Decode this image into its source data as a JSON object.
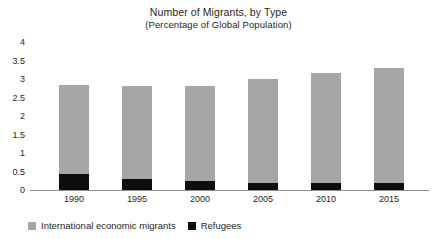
{
  "chart_data": {
    "type": "bar",
    "title": "Number of Migrants, by Type",
    "subtitle": "(Percentage of Global Population)",
    "xlabel": "",
    "ylabel": "",
    "stacked": true,
    "grid": false,
    "legend_position": "bottom-left",
    "ylim": [
      0,
      4
    ],
    "yticks": [
      0,
      0.5,
      1,
      1.5,
      2,
      2.5,
      3,
      3.5,
      4
    ],
    "ytick_labels": [
      "0",
      "0.5",
      "1",
      "1.5",
      "2",
      "2.5",
      "3",
      "3.5",
      "4"
    ],
    "categories": [
      "1990",
      "1995",
      "2000",
      "2005",
      "2010",
      "2015"
    ],
    "series": [
      {
        "name": "International economic migrants",
        "color": "#a6a6a6",
        "values": [
          2.42,
          2.5,
          2.55,
          2.8,
          2.95,
          3.1
        ]
      },
      {
        "name": "Refugees",
        "color": "#0d0d0d",
        "values": [
          0.43,
          0.3,
          0.25,
          0.2,
          0.2,
          0.2
        ]
      }
    ],
    "totals": [
      2.85,
      2.8,
      2.8,
      3.0,
      3.15,
      3.3
    ]
  },
  "legend": [
    {
      "label": "International economic migrants",
      "swatch": "economic"
    },
    {
      "label": "Refugees",
      "swatch": "refugees"
    }
  ]
}
